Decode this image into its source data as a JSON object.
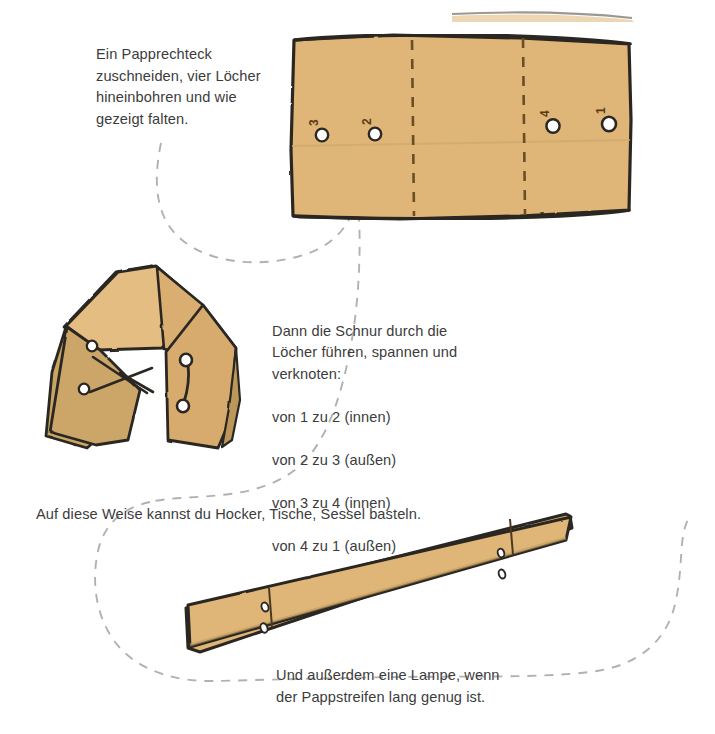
{
  "page": {
    "background": "#ffffff",
    "width": 715,
    "height": 734
  },
  "colors": {
    "cardboard": "#dfb677",
    "cardboard_shade": "#c4a263",
    "cardboard_dark": "#b2924f",
    "ink": "#2b2723",
    "text": "#3c3c3c",
    "flow_dash": "#b0b0b0",
    "hole_fill": "#ffffff"
  },
  "captions": {
    "step1": "Ein Papprechteck\nzuschneiden, vier Löcher\nhineinbohren und wie\ngezeigt falten.",
    "step2_intro": "Dann die Schnur durch die\nLöcher führen, spannen und\nverknoten:",
    "step2_lines": [
      "von 1 zu 2 (innen)",
      "von 2 zu 3 (außen)",
      "von 3 zu 4 (innen)",
      "von 4 zu 1 (außen)"
    ],
    "step3": "Auf diese Weise kannst du Hocker, Tische, Sessel basteln.",
    "step4": "Und außerdem eine Lampe, wenn\nder Pappstreifen lang genug ist."
  },
  "figures": {
    "flat_sheet": {
      "name": "Papprechteck mit vier Löchern",
      "hole_labels": [
        "3",
        "2",
        "4",
        "1"
      ],
      "fold_lines": 2,
      "holes": 4
    },
    "folded_stool": {
      "name": "Gefalteter Hocker mit Schnur",
      "visible_holes": 4,
      "string_segments": 4
    },
    "long_strip": {
      "name": "Langer Pappstreifen für Lampe",
      "holes": 4,
      "fold_lines": 2
    }
  },
  "flow": {
    "name": "gestrichelte Verlaufslinie",
    "style": "dashed"
  }
}
